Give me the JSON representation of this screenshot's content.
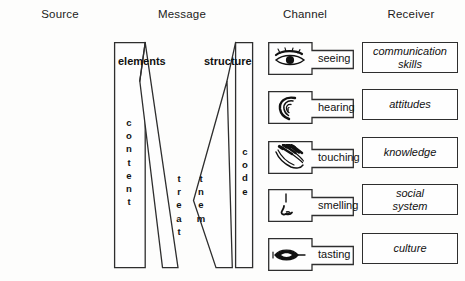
{
  "diagram": {
    "width": 465,
    "height": 281,
    "ink_color": "#2e2e2e",
    "text_color": "#111111",
    "background": "#fdfdfc"
  },
  "headers": [
    {
      "label": "Source",
      "x": 60,
      "y": 8
    },
    {
      "label": "Message",
      "x": 182,
      "y": 8
    },
    {
      "label": "Channel",
      "x": 305,
      "y": 8
    },
    {
      "label": "Receiver",
      "x": 411,
      "y": 8
    }
  ],
  "source": {
    "header": "Source",
    "items": [
      {
        "lines": [
          "communication",
          "skills"
        ],
        "x": 9,
        "y": 42,
        "w": 98,
        "h": 31
      },
      {
        "lines": [
          "attitudes"
        ],
        "x": 9,
        "y": 89,
        "w": 98,
        "h": 31
      },
      {
        "lines": [
          "knowledge"
        ],
        "x": 9,
        "y": 137,
        "w": 98,
        "h": 31
      },
      {
        "lines": [
          "social",
          "system"
        ],
        "x": 9,
        "y": 184,
        "w": 98,
        "h": 31
      },
      {
        "lines": [
          "culture"
        ],
        "x": 9,
        "y": 233,
        "w": 98,
        "h": 31
      }
    ]
  },
  "message": {
    "header": "Message",
    "top_labels": [
      {
        "label": "elements",
        "x": 119,
        "y": 55
      },
      {
        "label": "structure",
        "x": 205,
        "y": 55
      }
    ],
    "vertical_words": [
      {
        "word": "content",
        "letters": [
          "c",
          "o",
          "n",
          "t",
          "e",
          "n",
          "t"
        ],
        "x": 118,
        "y": 116
      },
      {
        "word": "treat",
        "letters": [
          "t",
          "r",
          "e",
          "a",
          "t"
        ],
        "x": 173,
        "y": 172
      },
      {
        "word": "tnem",
        "letters": [
          "t",
          "n",
          "e",
          "m"
        ],
        "x": 194,
        "y": 172
      },
      {
        "word": "code",
        "letters": [
          "c",
          "o",
          "d",
          "e"
        ],
        "x": 240,
        "y": 145
      }
    ],
    "note": "center letters spell 'treatment' split into two descending columns"
  },
  "channel": {
    "header": "Channel",
    "items": [
      {
        "label": "seeing",
        "icon": "eye-icon",
        "x": 268,
        "y": 42
      },
      {
        "label": "hearing",
        "icon": "ear-icon",
        "x": 268,
        "y": 91
      },
      {
        "label": "touching",
        "icon": "hand-icon",
        "x": 268,
        "y": 141
      },
      {
        "label": "smelling",
        "icon": "nose-icon",
        "x": 268,
        "y": 189
      },
      {
        "label": "tasting",
        "icon": "tongue-icon",
        "x": 268,
        "y": 238
      }
    ]
  },
  "receiver": {
    "header": "Receiver",
    "items": [
      {
        "lines": [
          "communication",
          "skills"
        ],
        "x": 362,
        "y": 42,
        "w": 96,
        "h": 31
      },
      {
        "lines": [
          "attitudes"
        ],
        "x": 362,
        "y": 89,
        "w": 96,
        "h": 31
      },
      {
        "lines": [
          "knowledge"
        ],
        "x": 362,
        "y": 137,
        "w": 96,
        "h": 31
      },
      {
        "lines": [
          "social",
          "system"
        ],
        "x": 362,
        "y": 184,
        "w": 96,
        "h": 31
      },
      {
        "lines": [
          "culture"
        ],
        "x": 362,
        "y": 233,
        "w": 96,
        "h": 31
      }
    ]
  }
}
